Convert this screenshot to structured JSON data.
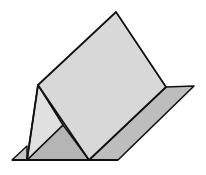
{
  "diagram": {
    "colors": {
      "background": "#ffffff",
      "main_face": "#d9d9d9",
      "left_face": "#e2e2e2",
      "base_sheet": "#b9b9b9",
      "inner_shadow": "#b3b3b3",
      "outline": "#111111"
    },
    "points": {
      "apex": [
        116,
        12
      ],
      "left_ridge": [
        38,
        85
      ],
      "right_ridge_base": [
        166,
        87
      ],
      "base_right_corner": [
        194,
        86
      ],
      "base_bottom_right": [
        118,
        160
      ],
      "main_face_bottom": [
        89,
        160
      ],
      "left_face_bottom": [
        27,
        160
      ],
      "base_far_left": [
        12,
        160
      ],
      "inner_fold": [
        63,
        125
      ],
      "left_flap_top": [
        27,
        146
      ]
    }
  }
}
